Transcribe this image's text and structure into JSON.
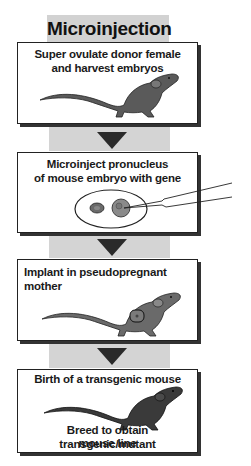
{
  "title": "Microinjection",
  "colors": {
    "band": "#d4d4d4",
    "arrow": "#2a2a2a",
    "mouse_gray": "#5a5a5a",
    "mouse_dark": "#3a3a3a",
    "border": "#222222"
  },
  "steps": [
    {
      "label": "Super ovulate donor female and harvest embryos",
      "lines": [
        "Super ovulate donor female",
        "and harvest embryos"
      ],
      "icon": "mouse-icon"
    },
    {
      "label": "Microinject pronucleus of mouse embryo with gene",
      "lines": [
        "Microinject pronucleus",
        "of mouse embryo with gene"
      ],
      "icon": "embryo-injection-icon"
    },
    {
      "label": "Implant in pseudopregnant mother",
      "lines": [
        "Implant in pseudopregnant mother"
      ],
      "icon": "pregnant-mouse-icon"
    },
    {
      "label": "Birth of a transgenic mouse",
      "lines": [
        "Birth of a transgenic mouse"
      ],
      "footer_lines": [
        "Breed to obtain transgenic/mutant",
        "mouse line"
      ],
      "icon": "transgenic-mouse-icon"
    }
  ]
}
